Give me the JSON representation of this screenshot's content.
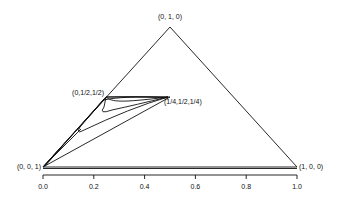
{
  "vertices": {
    "top": "(0, 1, 0)",
    "bottom_left": "(0, 0, 1)",
    "bottom_right": "(1, 0, 0)"
  },
  "points": {
    "midpoint_left": "(0,1/2,1/2)",
    "midpoint_right": "(1/4,1/2,1/4)"
  },
  "axis": {
    "ticks": [
      "0.0",
      "0.2",
      "0.4",
      "0.6",
      "0.8",
      "1.0"
    ]
  }
}
